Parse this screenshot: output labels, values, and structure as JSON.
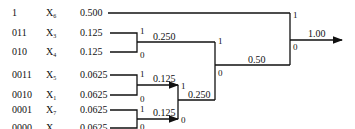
{
  "symbols": [
    {
      "code": "1",
      "name": "X",
      "sub": "6",
      "prob": "0.500"
    },
    {
      "code": "011",
      "name": "X",
      "sub": "3",
      "prob": "0.125"
    },
    {
      "code": "010",
      "name": "X",
      "sub": "4",
      "prob": "0.125"
    },
    {
      "code": "0011",
      "name": "X",
      "sub": "5",
      "prob": "0.0625"
    },
    {
      "code": "0010",
      "name": "X",
      "sub": "1",
      "prob": "0.0625"
    },
    {
      "code": "0001",
      "name": "X",
      "sub": "7",
      "prob": "0.0625"
    },
    {
      "code": "0000",
      "name": "X",
      "sub": "2",
      "prob": "0.0625"
    }
  ],
  "nodes": {
    "n34": {
      "value": "0.250",
      "bit_top": "1",
      "bit_bottom": "0"
    },
    "n51": {
      "value": "0.125",
      "bit_top": "1",
      "bit_bottom": "0"
    },
    "n72": {
      "value": "0.125",
      "bit_top": "1",
      "bit_bottom": "0"
    },
    "n5172": {
      "value": "0.250",
      "bit_top": "1",
      "bit_bottom": "0"
    },
    "n_half": {
      "value": "0.50",
      "bit_top": "1",
      "bit_bottom": "0"
    },
    "root": {
      "value": "1.00",
      "bit_top": "1",
      "bit_bottom": "0"
    }
  }
}
